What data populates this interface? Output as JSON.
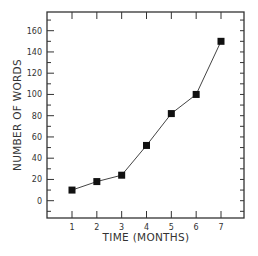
{
  "chart_data": {
    "type": "line",
    "title": "",
    "xlabel": "TIME (MONTHS)",
    "ylabel": "NUMBER OF WORDS",
    "x": [
      1,
      2,
      3,
      4,
      5,
      6,
      7
    ],
    "series": [
      {
        "name": "Number of words",
        "values": [
          10,
          18,
          24,
          52,
          82,
          100,
          150
        ],
        "marker": "square",
        "color": "#111111"
      }
    ],
    "x_ticks": [
      "1",
      "2",
      "3",
      "4",
      "5",
      "6",
      "7"
    ],
    "y_ticks": [
      "0",
      "20",
      "40",
      "60",
      "80",
      "100",
      "120",
      "140",
      "160"
    ],
    "xlim": [
      0,
      8
    ],
    "ylim": [
      -17,
      176
    ],
    "grid": false,
    "legend": "none"
  }
}
